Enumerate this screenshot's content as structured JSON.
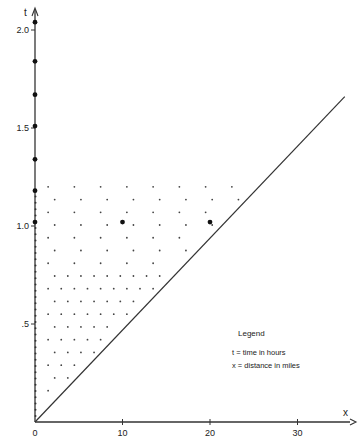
{
  "chart_data": {
    "type": "scatter",
    "title": "",
    "xlabel": "x",
    "ylabel": "t",
    "xlim": [
      0,
      36
    ],
    "ylim": [
      0,
      2.15
    ],
    "x_ticks": [
      0,
      10,
      20,
      30
    ],
    "x_tick_labels": [
      "0",
      "10",
      "20",
      "30"
    ],
    "y_ticks": [
      0.5,
      1.0,
      1.5,
      2.0
    ],
    "y_tick_labels": [
      ".5",
      "1.0",
      "1.5",
      "2.0"
    ],
    "grid": false,
    "legend": {
      "title": "Legend",
      "entries": [
        "t = time in hours",
        "x = distance in miles"
      ],
      "position": "lower-right"
    },
    "reference_line": {
      "from": [
        0,
        0
      ],
      "to": [
        35.4,
        1.66
      ],
      "description": "straight diagonal line from origin"
    },
    "series": [
      {
        "name": "large points on t-axis",
        "points": [
          [
            0,
            1.02
          ],
          [
            0,
            1.18
          ],
          [
            0,
            1.34
          ],
          [
            0,
            1.51
          ],
          [
            0,
            1.67
          ],
          [
            0,
            1.84
          ],
          [
            0,
            2.04
          ]
        ]
      },
      {
        "name": "large points in field",
        "points": [
          [
            10,
            1.02
          ],
          [
            20,
            1.02
          ]
        ]
      },
      {
        "name": "small lattice points",
        "region": "0 < x, t above diagonal, t <= 1.2",
        "x_spacing_near_axis": 1.5,
        "x_spacing_far": 3,
        "t_spacing": 0.065
      }
    ]
  }
}
